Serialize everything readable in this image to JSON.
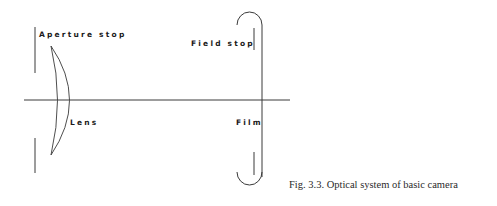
{
  "figure": {
    "caption": "Fig. 3.3. Optical system of basic camera",
    "labels": {
      "aperture_stop": "Aperture stop",
      "field_stop": "Field stop",
      "lens": "Lens",
      "film": "Film"
    },
    "colors": {
      "line": "#3a3a3a",
      "text": "#1a1a1a",
      "background": "#ffffff"
    }
  }
}
